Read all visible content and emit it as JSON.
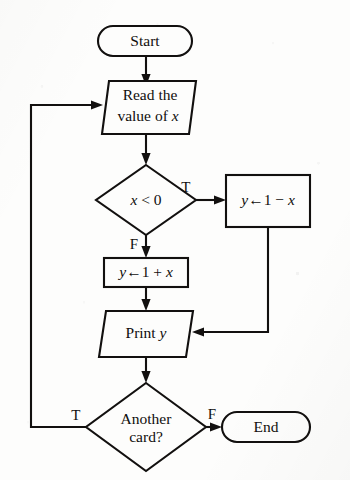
{
  "diagram": {
    "background_color": "#fdfdfc",
    "ink_color": "#12100f",
    "nodes": {
      "start": {
        "id": "start",
        "shape": "terminal",
        "label": "Start"
      },
      "read": {
        "id": "read",
        "shape": "parallelogram",
        "label_line1": "Read the",
        "label_line2_prefix": "value of ",
        "label_line2_var": "x"
      },
      "test": {
        "id": "test",
        "shape": "diamond",
        "label_var": "x",
        "label_rest": " < 0"
      },
      "assign_minus": {
        "id": "assign_minus",
        "shape": "rectangle",
        "label_var1": "y",
        "label_arrow": "←",
        "label_mid": "1 − ",
        "label_var2": "x"
      },
      "assign_plus": {
        "id": "assign_plus",
        "shape": "rectangle",
        "label_var1": "y",
        "label_arrow": "←",
        "label_mid": "1 + ",
        "label_var2": "x"
      },
      "print": {
        "id": "print",
        "shape": "parallelogram",
        "label_text": "Print ",
        "label_var": "y"
      },
      "another": {
        "id": "another",
        "shape": "diamond",
        "label_line1": "Another",
        "label_line2": "card?"
      },
      "end": {
        "id": "end",
        "shape": "terminal",
        "label": "End"
      }
    },
    "branch_labels": {
      "test_true": "T",
      "test_false": "F",
      "another_true": "T",
      "another_false": "F"
    },
    "edges": [
      {
        "from": "start",
        "to": "read",
        "label": ""
      },
      {
        "from": "read",
        "to": "test",
        "label": ""
      },
      {
        "from": "test",
        "to": "assign_minus",
        "label": "T"
      },
      {
        "from": "test",
        "to": "assign_plus",
        "label": "F"
      },
      {
        "from": "assign_plus",
        "to": "print",
        "label": ""
      },
      {
        "from": "assign_minus",
        "to": "print",
        "label": ""
      },
      {
        "from": "print",
        "to": "another",
        "label": ""
      },
      {
        "from": "another",
        "to": "end",
        "label": "F"
      },
      {
        "from": "another",
        "to": "read",
        "label": "T"
      }
    ]
  }
}
